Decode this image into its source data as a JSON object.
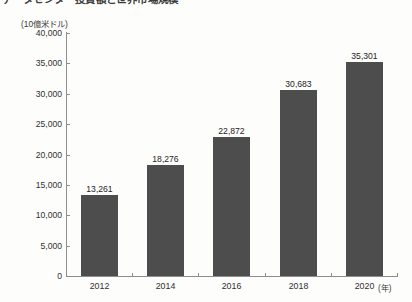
{
  "title": {
    "text": "データセンター投資額と世界市場規模",
    "clipped": true
  },
  "axis": {
    "y_unit_label": "(10億米ドル)",
    "x_unit_label": "(年)"
  },
  "chart_data": {
    "type": "bar",
    "title": "データセンター投資額と世界市場規模",
    "xlabel": "(年)",
    "ylabel": "(10億米ドル)",
    "ylim": [
      0,
      40000
    ],
    "ytick_labels": [
      "40,000",
      "35,000",
      "30,000",
      "25,000",
      "20,000",
      "15,000",
      "10,000",
      "5,000",
      "0"
    ],
    "ytick_values": [
      40000,
      35000,
      30000,
      25000,
      20000,
      15000,
      10000,
      5000,
      0
    ],
    "grid": false,
    "legend": "none",
    "bar_color": "#4d4d4d",
    "categories": [
      "2012",
      "2014",
      "2016",
      "2018",
      "2020"
    ],
    "values": [
      13261,
      18276,
      22872,
      30683,
      35301
    ],
    "value_labels": [
      "13,261",
      "18,276",
      "22,872",
      "30,683",
      "35,301"
    ]
  }
}
